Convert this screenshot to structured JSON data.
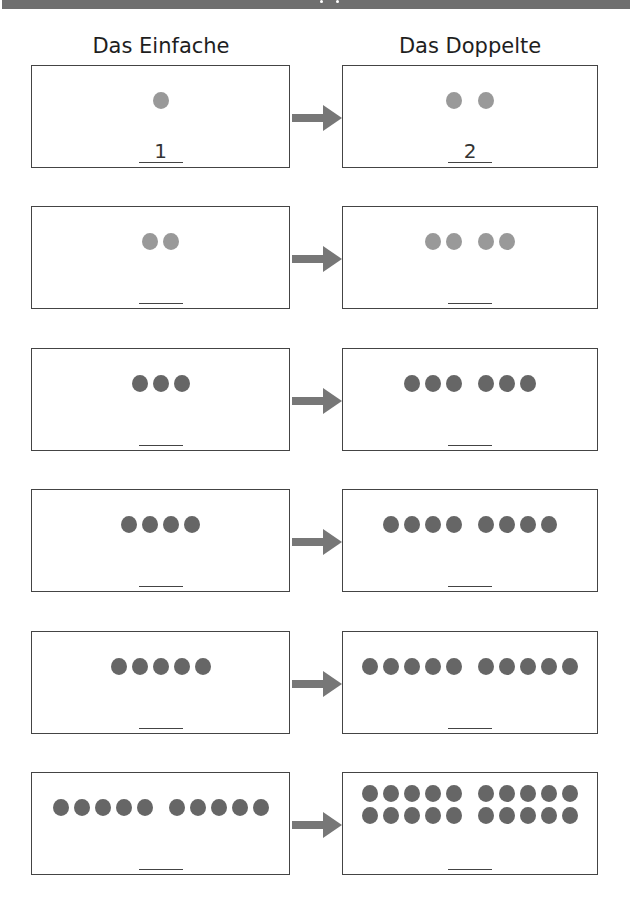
{
  "header": {
    "bar_color": "#6f6f6f"
  },
  "columns": {
    "left_title": "Das Einfache",
    "right_title": "Das Doppelte"
  },
  "colors": {
    "dot_light": "#999999",
    "dot_dark": "#666666",
    "arrow": "#777777",
    "border": "#444444"
  },
  "rows": [
    {
      "single": 1,
      "double": 2,
      "single_answer": "1",
      "double_answer": "2",
      "tone": "light"
    },
    {
      "single": 2,
      "double": 4,
      "single_answer": "",
      "double_answer": "",
      "tone": "light"
    },
    {
      "single": 3,
      "double": 6,
      "single_answer": "",
      "double_answer": "",
      "tone": "dark"
    },
    {
      "single": 4,
      "double": 8,
      "single_answer": "",
      "double_answer": "",
      "tone": "dark"
    },
    {
      "single": 5,
      "double": 10,
      "single_answer": "",
      "double_answer": "",
      "tone": "dark"
    },
    {
      "single": 10,
      "double": 20,
      "single_answer": "",
      "double_answer": "",
      "tone": "dark"
    }
  ]
}
